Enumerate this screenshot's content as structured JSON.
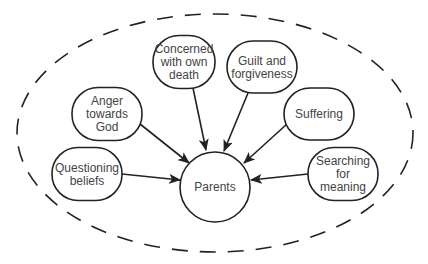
{
  "diagram": {
    "center": {
      "id": "parents",
      "label": "Parents"
    },
    "nodes": [
      {
        "id": "questioning-beliefs",
        "lines": [
          "Questioning",
          "beliefs"
        ]
      },
      {
        "id": "anger-towards-god",
        "lines": [
          "Anger",
          "towards",
          "God"
        ]
      },
      {
        "id": "concerned-with-own-death",
        "lines": [
          "Concerned",
          "with own",
          "death"
        ]
      },
      {
        "id": "guilt-and-forgiveness",
        "lines": [
          "Guilt and",
          "forgiveness"
        ]
      },
      {
        "id": "suffering",
        "lines": [
          "Suffering"
        ]
      },
      {
        "id": "searching-for-meaning",
        "lines": [
          "Searching",
          "for",
          "meaning"
        ]
      }
    ],
    "edges": [
      {
        "from": "questioning-beliefs",
        "to": "parents"
      },
      {
        "from": "anger-towards-god",
        "to": "parents"
      },
      {
        "from": "concerned-with-own-death",
        "to": "parents"
      },
      {
        "from": "guilt-and-forgiveness",
        "to": "parents"
      },
      {
        "from": "suffering",
        "to": "parents"
      },
      {
        "from": "searching-for-meaning",
        "to": "parents"
      }
    ],
    "boundary": {
      "style": "dashed"
    },
    "colors": {
      "stroke": "#222222",
      "text": "#444444",
      "background": "#ffffff"
    }
  }
}
